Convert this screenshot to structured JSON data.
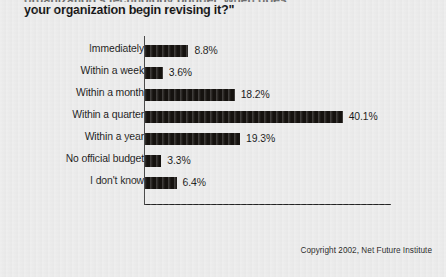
{
  "title": {
    "clipped_line_above": "organization's technology budget, when does",
    "line": "your organization begin revising it?\""
  },
  "footer": {
    "copyright": "Copyright 2002, Net Future Institute"
  },
  "axis": {
    "ticks": [
      "0%",
      "10%",
      "20%",
      "30%",
      "40%",
      "50%"
    ],
    "tick_values": [
      0,
      10,
      20,
      30,
      40,
      50
    ]
  },
  "colors": {
    "background": "#ececec",
    "bar": "#15120f",
    "axis": "#232323",
    "text": "#161616"
  },
  "chart_data": {
    "type": "bar",
    "orientation": "horizontal",
    "title": "your organization begin revising it?\"",
    "xlabel": "",
    "ylabel": "",
    "xlim": [
      0,
      50
    ],
    "grid": false,
    "legend": false,
    "categories": [
      "Immediately",
      "Within a week",
      "Within a month",
      "Within a quarter",
      "Within a year",
      "No official budget",
      "I don't know"
    ],
    "values": [
      8.8,
      3.6,
      18.2,
      40.1,
      19.3,
      3.3,
      6.4
    ],
    "value_labels": [
      "8.8%",
      "3.6%",
      "18.2%",
      "40.1%",
      "19.3%",
      "3.3%",
      "6.4%"
    ],
    "tick_labels": [
      "0%",
      "10%",
      "20%",
      "30%",
      "40%",
      "50%"
    ],
    "source": "Copyright 2002, Net Future Institute"
  }
}
